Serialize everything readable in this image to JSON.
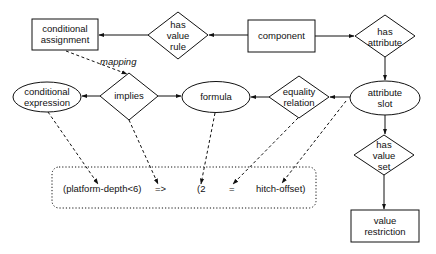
{
  "diagram": {
    "nodes": {
      "conditional_assignment": {
        "label_line1": "conditional",
        "label_line2": "assignment",
        "shape": "rectangle"
      },
      "has_value_rule": {
        "label_line1": "has",
        "label_line2": "value",
        "label_line3": "rule",
        "shape": "diamond"
      },
      "component": {
        "label": "component",
        "shape": "rectangle"
      },
      "has_attribute": {
        "label_line1": "has",
        "label_line2": "attribute",
        "shape": "diamond"
      },
      "conditional_expression": {
        "label_line1": "conditional",
        "label_line2": "expression",
        "shape": "ellipse"
      },
      "implies": {
        "label": "implies",
        "shape": "diamond"
      },
      "formula": {
        "label": "formula",
        "shape": "ellipse"
      },
      "equality_relation": {
        "label_line1": "equality",
        "label_line2": "relation",
        "shape": "diamond"
      },
      "attribute_slot": {
        "label_line1": "attribute",
        "label_line2": "slot",
        "shape": "ellipse"
      },
      "has_value_set": {
        "label_line1": "has",
        "label_line2": "value",
        "label_line3": "set",
        "shape": "diamond"
      },
      "value_restriction": {
        "label_line1": "value",
        "label_line2": "restriction",
        "shape": "rectangle"
      }
    },
    "edge_labels": {
      "mapping": "mapping"
    },
    "expression": {
      "part1": "(platform-depth<6)",
      "part2": "=>",
      "part3": "(2",
      "part4": "=",
      "part5": "hitch-offset)"
    },
    "edges": [
      {
        "from": "component",
        "to": "has_value_rule",
        "style": "solid"
      },
      {
        "from": "has_value_rule",
        "to": "conditional_assignment",
        "style": "solid"
      },
      {
        "from": "component",
        "to": "has_attribute",
        "style": "solid"
      },
      {
        "from": "has_attribute",
        "to": "attribute_slot",
        "style": "solid"
      },
      {
        "from": "attribute_slot",
        "to": "equality_relation",
        "style": "solid"
      },
      {
        "from": "equality_relation",
        "to": "formula",
        "style": "solid"
      },
      {
        "from": "implies",
        "to": "formula",
        "style": "solid"
      },
      {
        "from": "implies",
        "to": "conditional_expression",
        "style": "solid"
      },
      {
        "from": "attribute_slot",
        "to": "has_value_set",
        "style": "solid"
      },
      {
        "from": "has_value_set",
        "to": "value_restriction",
        "style": "solid"
      },
      {
        "from": "conditional_assignment",
        "to": "implies",
        "style": "dashed",
        "label": "mapping"
      },
      {
        "from": "conditional_expression",
        "to": "expression.part1",
        "style": "dashed"
      },
      {
        "from": "implies",
        "to": "expression.part2",
        "style": "dashed"
      },
      {
        "from": "formula",
        "to": "expression.part3",
        "style": "dashed"
      },
      {
        "from": "equality_relation",
        "to": "expression.part4",
        "style": "dashed"
      },
      {
        "from": "attribute_slot",
        "to": "expression.part5",
        "style": "dashed"
      }
    ],
    "colors": {
      "stroke": "#111111",
      "background": "#ffffff"
    }
  }
}
